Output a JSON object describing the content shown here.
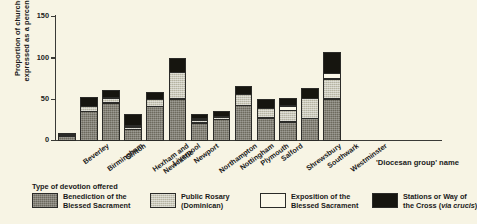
{
  "chart_data": {
    "type": "bar",
    "subtype": "stacked",
    "title": "",
    "xlabel": "'Diocesan group' name",
    "ylabel": "Proportion of churches, expressed as a percentage",
    "ylim": [
      0,
      150
    ],
    "yticks": [
      0,
      50,
      100,
      150
    ],
    "grid": false,
    "legend_position": "bottom",
    "legend_title": "Type of devotion offered",
    "categories": [
      "Beverley",
      "Birmingham",
      "Clifton",
      "Hexham and Newcastle",
      "Liverpool",
      "Newport",
      "Northampton",
      "Nottingham",
      "Plymouth",
      "Salford",
      "Shrewsbury",
      "Southwark",
      "Westminster"
    ],
    "category_lines": [
      [
        "Beverley"
      ],
      [
        "Birmingham"
      ],
      [
        "Clifton"
      ],
      [
        "Hexham and",
        "Newcastle"
      ],
      [
        "Liverpool"
      ],
      [
        "Newport"
      ],
      [
        "Northampton"
      ],
      [
        "Nottingham"
      ],
      [
        "Plymouth"
      ],
      [
        "Salford"
      ],
      [
        "Shrewsbury"
      ],
      [
        "Southwark"
      ],
      [
        "Westminster"
      ]
    ],
    "series": [
      {
        "name": "Benediction of the Blessed Sacrament",
        "name_lines": [
          "Benediction of the",
          "Blessed Sacrament"
        ],
        "color": "#6d6a5e",
        "values": [
          6,
          36,
          46,
          14,
          42,
          51,
          22,
          26,
          43,
          28,
          23,
          27,
          51
        ]
      },
      {
        "name": "Public Rosary (Dominican)",
        "name_lines": [
          "Public Rosary",
          "(Dominican)"
        ],
        "color": "#c9c7b6",
        "values": [
          2,
          7,
          7,
          4,
          9,
          33,
          4,
          4,
          14,
          12,
          15,
          25,
          25
        ]
      },
      {
        "name": "Exposition of the Blessed Sacrament",
        "name_lines": [
          "Exposition of the",
          "Blessed Sacrament"
        ],
        "color": "#fbf8e9",
        "values": [
          0,
          0,
          0,
          2,
          0,
          0,
          2,
          0,
          0,
          0,
          6,
          0,
          7
        ]
      },
      {
        "name": "Stations or Way of the Cross (via crucis)",
        "name_lines": [
          "Stations or Way of",
          "the Cross (via crucis)"
        ],
        "name_line2_plain": "the Cross (",
        "name_line2_italic": "via crucis",
        "name_line2_tail": ")",
        "color": "#16150f",
        "values": [
          3,
          12,
          10,
          15,
          9,
          18,
          7,
          8,
          11,
          12,
          10,
          14,
          27
        ]
      }
    ],
    "totals": [
      11,
      55,
      63,
      35,
      60,
      102,
      35,
      38,
      68,
      52,
      54,
      66,
      110
    ]
  }
}
